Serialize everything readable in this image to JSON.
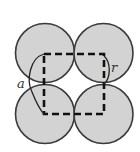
{
  "figure": {
    "colors": {
      "circle_fill": "#d3d3d3",
      "circle_stroke": "#3a3a3a",
      "dash_stroke": "#111111",
      "arc_stroke": "#222222"
    },
    "circles": [
      {
        "id": "top-left",
        "cx": 45,
        "cy": 53,
        "r": 29.5
      },
      {
        "id": "top-right",
        "cx": 103.5,
        "cy": 53,
        "r": 29.5
      },
      {
        "id": "bottom-left",
        "cx": 45,
        "cy": 114,
        "r": 29.5
      },
      {
        "id": "bottom-right",
        "cx": 103.5,
        "cy": 114,
        "r": 29.5
      }
    ],
    "square": {
      "x1": 44,
      "y1": 54,
      "x2": 104,
      "y2": 114
    },
    "labels": {
      "a": "a",
      "r": "r"
    }
  }
}
